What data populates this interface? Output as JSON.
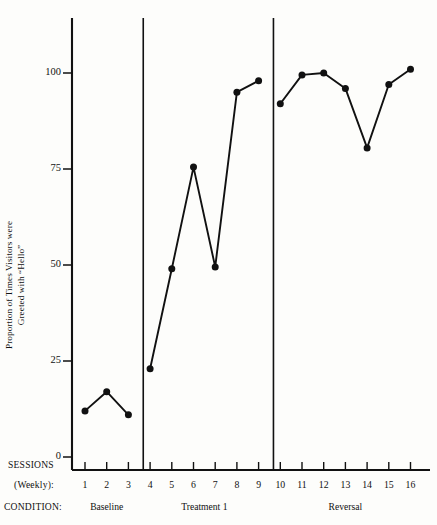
{
  "axis": {
    "ylabel_line1": "Proportion of Times Visitors were",
    "ylabel_line2": "Greeted with “Hello”",
    "ytick_labels": [
      "0",
      "25",
      "50",
      "75",
      "100"
    ],
    "sessions_label_line1": "SESSIONS",
    "sessions_label_line2": "(Weekly):",
    "condition_label": "CONDITION:"
  },
  "phases": [
    {
      "name": "Baseline",
      "sessions": [
        1,
        2,
        3
      ]
    },
    {
      "name": "Treatment  1",
      "sessions": [
        4,
        5,
        6,
        7,
        8,
        9
      ]
    },
    {
      "name": "Reversal",
      "sessions": [
        10,
        11,
        12,
        13,
        14,
        15,
        16
      ]
    }
  ],
  "chart_data": {
    "type": "line",
    "title": "",
    "xlabel": "SESSIONS (Weekly):",
    "ylabel": "Proportion of Times Visitors were Greeted with “Hello”",
    "ylim": [
      0,
      112
    ],
    "xlim": [
      0.3,
      17.2
    ],
    "yticks": [
      0,
      25,
      50,
      75,
      100
    ],
    "grid": false,
    "legend": "none",
    "x": [
      1,
      2,
      3,
      4,
      5,
      6,
      7,
      8,
      9,
      10,
      11,
      12,
      13,
      14,
      15,
      16
    ],
    "categories": [
      "1",
      "2",
      "3",
      "4",
      "5",
      "6",
      "7",
      "8",
      "9",
      "10",
      "11",
      "12",
      "13",
      "14",
      "15",
      "16"
    ],
    "series": [
      {
        "name": "Baseline",
        "x": [
          1,
          2,
          3
        ],
        "values": [
          12,
          17,
          11
        ]
      },
      {
        "name": "Treatment  1",
        "x": [
          4,
          5,
          6,
          7,
          8,
          9
        ],
        "values": [
          23,
          49,
          75.5,
          49.5,
          95,
          98
        ]
      },
      {
        "name": "Reversal",
        "x": [
          10,
          11,
          12,
          13,
          14,
          15,
          16
        ],
        "values": [
          92,
          99.5,
          100,
          96,
          80.5,
          97,
          101
        ]
      }
    ],
    "phase_lines_after_session": [
      3,
      9
    ],
    "marker": "filled-circle",
    "line_color": "#111111",
    "marker_color": "#111111"
  }
}
